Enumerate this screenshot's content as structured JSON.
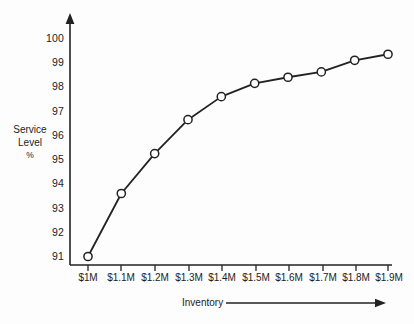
{
  "chart_data": {
    "type": "line",
    "title": "",
    "subtitle": "",
    "xlabel": "Inventory",
    "ylabel": "Service Level %",
    "ylabel_lines": [
      "Service",
      "Level",
      "%"
    ],
    "categories": [
      "$1M",
      "$1.1M",
      "$1.2M",
      "$1.3M",
      "$1.4M",
      "$1.5M",
      "$1.6M",
      "$1.7M",
      "$1.8M",
      "$1.9M"
    ],
    "x_values": [
      1.0,
      1.1,
      1.2,
      1.3,
      1.4,
      1.5,
      1.6,
      1.7,
      1.8,
      1.9
    ],
    "values": [
      91.0,
      93.6,
      95.25,
      96.65,
      97.6,
      98.15,
      98.4,
      98.62,
      99.1,
      99.35
    ],
    "series": [
      {
        "name": "Service Level",
        "values": [
          91.0,
          93.6,
          95.25,
          96.65,
          97.6,
          98.15,
          98.4,
          98.62,
          99.1,
          99.35
        ],
        "marker": "open-circle",
        "line_color": "#222222",
        "marker_fill": "#ffffff"
      }
    ],
    "y_ticks": [
      100,
      99,
      98,
      97,
      96,
      95,
      94,
      93,
      92,
      91
    ],
    "ylim": [
      90.5,
      100.4
    ],
    "xlim": [
      0.95,
      1.95
    ],
    "grid": false,
    "legend": false,
    "legend_position": "none",
    "x_axis_arrow": true,
    "y_axis_arrow": true,
    "annotations": []
  },
  "colors": {
    "background": "#fdfdfd",
    "axis": "#222222",
    "line": "#222222",
    "marker_fill": "#ffffff",
    "text": "#1c1c1c"
  }
}
